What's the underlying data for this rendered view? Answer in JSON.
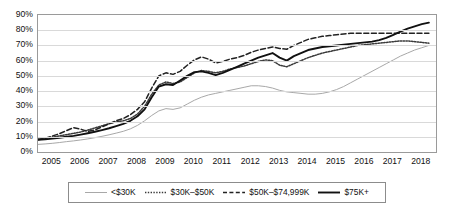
{
  "chart_data": {
    "type": "line",
    "title": "",
    "xlabel": "",
    "ylabel": "",
    "ylim": [
      0,
      90
    ],
    "ytick_labels": [
      "0%",
      "10%",
      "20%",
      "30%",
      "40%",
      "50%",
      "60%",
      "70%",
      "80%",
      "90%"
    ],
    "ytick_values": [
      0,
      10,
      20,
      30,
      40,
      50,
      60,
      70,
      80,
      90
    ],
    "grid": true,
    "legend_position": "bottom",
    "x": [
      2005,
      2005.25,
      2005.5,
      2005.75,
      2006,
      2006.25,
      2006.5,
      2006.75,
      2007,
      2007.25,
      2007.5,
      2007.75,
      2008,
      2008.25,
      2008.5,
      2008.75,
      2009,
      2009.25,
      2009.5,
      2009.75,
      2010,
      2010.25,
      2010.5,
      2010.75,
      2011,
      2011.25,
      2011.5,
      2011.75,
      2012,
      2012.25,
      2012.5,
      2012.75,
      2013,
      2013.25,
      2013.5,
      2013.75,
      2014,
      2014.25,
      2014.5,
      2014.75,
      2015,
      2015.25,
      2015.5,
      2015.75,
      2016,
      2016.25,
      2016.5,
      2016.75,
      2017,
      2017.25,
      2017.5,
      2017.75,
      2018,
      2018.25,
      2018.5,
      2018.75
    ],
    "xtick_labels": [
      "2005",
      "2006",
      "2007",
      "2008",
      "2009",
      "2010",
      "2011",
      "2012",
      "2013",
      "2014",
      "2015",
      "2016",
      "2017",
      "2018"
    ],
    "xtick_values": [
      2005,
      2006,
      2007,
      2008,
      2009,
      2010,
      2011,
      2012,
      2013,
      2014,
      2015,
      2016,
      2017,
      2018
    ],
    "series": [
      {
        "name": "<$30K",
        "style": "solid-light",
        "color": "#a8a8a8",
        "width": 1.0,
        "values": [
          5,
          5.3,
          5.7,
          6.2,
          6.8,
          7.3,
          7.9,
          8.6,
          9.4,
          10.3,
          11.3,
          12.4,
          13.6,
          15.2,
          17.5,
          20.5,
          24,
          27,
          28.5,
          28,
          29,
          31.5,
          34,
          36,
          37.5,
          38.5,
          39.5,
          40.5,
          41.5,
          42.5,
          43.5,
          43.5,
          43,
          42,
          40.5,
          39.5,
          39,
          38.5,
          38,
          38,
          38.5,
          39.5,
          41,
          43,
          45.5,
          48,
          50.5,
          53,
          55.5,
          58,
          60.5,
          63,
          65,
          67,
          68.5,
          70
        ]
      },
      {
        "name": "$30K–$50K",
        "style": "dotted",
        "color": "#3a3a3a",
        "width": 1.5,
        "values": [
          8.5,
          9,
          9.8,
          10.6,
          11.4,
          12.2,
          13.2,
          14.4,
          15.8,
          17.2,
          18.6,
          19.8,
          20.5,
          22,
          25,
          30,
          38,
          44,
          46,
          45,
          46,
          49,
          52,
          53.5,
          53,
          52,
          53,
          54.5,
          55.5,
          56.5,
          58,
          59.5,
          60.5,
          60,
          57,
          56,
          58,
          60,
          62,
          63.5,
          65,
          66,
          67,
          68,
          69,
          70,
          70.5,
          71,
          71.5,
          72,
          72.5,
          73,
          73,
          72.5,
          72,
          71.5
        ]
      },
      {
        "name": "$50K–$74,999K",
        "style": "dashed",
        "color": "#222222",
        "width": 1.5,
        "values": [
          8,
          9,
          10.5,
          12,
          14,
          16,
          15,
          13.5,
          14.5,
          16.5,
          18.5,
          20.5,
          22,
          24.5,
          28,
          33,
          42,
          50,
          52,
          51,
          53,
          57,
          60.5,
          62.5,
          61,
          58.5,
          59.5,
          61,
          62,
          63.5,
          65.5,
          67,
          68,
          69,
          68,
          67.5,
          70,
          72,
          74,
          75,
          76,
          76.5,
          77,
          77.5,
          78,
          78,
          78,
          78,
          78,
          78,
          78,
          78,
          78,
          78,
          78,
          78
        ]
      },
      {
        "name": "$75K+",
        "style": "solid-bold",
        "color": "#111111",
        "width": 1.9,
        "values": [
          8,
          8.3,
          8.8,
          9.4,
          10,
          10.6,
          11.4,
          12.3,
          13.3,
          14.4,
          15.6,
          17,
          18.5,
          20.5,
          23.5,
          28,
          36,
          43,
          44.5,
          44,
          47,
          50,
          52.5,
          53,
          52,
          50.5,
          52,
          54,
          56,
          58,
          60,
          62,
          63.5,
          65,
          62,
          60,
          63,
          65,
          67,
          68,
          69,
          69.5,
          70,
          70.5,
          71,
          71.5,
          72,
          72.5,
          73.5,
          75,
          77,
          79,
          81,
          82.5,
          84,
          85
        ]
      }
    ]
  },
  "legend": {
    "items": [
      {
        "label": "<$30K"
      },
      {
        "label": "$30K–$50K"
      },
      {
        "label": "$50K–$74,999K"
      },
      {
        "label": "$75K+"
      }
    ]
  }
}
